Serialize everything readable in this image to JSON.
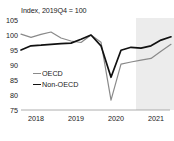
{
  "chart_data": {
    "type": "line",
    "title": "Index, 2019Q4 = 100",
    "xlabel": "",
    "ylabel": "",
    "ylim": [
      75,
      105
    ],
    "yticks": [
      105,
      100,
      95,
      90,
      85,
      80,
      75
    ],
    "xticks": [
      "2018",
      "2019",
      "2020",
      "2021"
    ],
    "grid": false,
    "legend_position": "inside-left",
    "x": [
      "2018Q1",
      "2018Q2",
      "2018Q3",
      "2018Q4",
      "2019Q1",
      "2019Q2",
      "2019Q3",
      "2019Q4",
      "2020Q1",
      "2020Q2",
      "2020Q3",
      "2020Q4",
      "2021Q1",
      "2021Q2",
      "2021Q3",
      "2021Q4"
    ],
    "series": [
      {
        "name": "OECD",
        "color": "#8a8a8a",
        "values": [
          100.3,
          99.2,
          100.2,
          101.0,
          99.0,
          98.0,
          97.5,
          100.0,
          97.6,
          78.3,
          90.3,
          91.0,
          91.6,
          92.2,
          94.6,
          96.9
        ]
      },
      {
        "name": "Non-OECD",
        "color": "#111111",
        "values": [
          95.0,
          96.4,
          96.6,
          96.9,
          97.1,
          97.3,
          98.6,
          100.0,
          96.4,
          85.9,
          94.9,
          95.9,
          95.6,
          96.4,
          98.3,
          99.4
        ]
      }
    ],
    "shaded_region": {
      "label": "forecast",
      "start": "2021Q1",
      "end": "2021Q4",
      "color": "#ececec"
    }
  },
  "legend": {
    "items": [
      {
        "label": "OECD"
      },
      {
        "label": "Non-OECD"
      }
    ]
  }
}
